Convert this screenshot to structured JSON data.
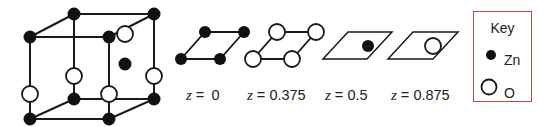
{
  "figure": {
    "colors": {
      "line": "#1a1a1a",
      "zn_fill": "#111111",
      "o_fill": "#ffffff",
      "key_border": "#b24f4a"
    }
  },
  "unit_cell": {
    "atoms": [
      "Zn corners (8)",
      "O on vertical edges (4)",
      "Zn interior (1)",
      "O interior (1)"
    ]
  },
  "layers": [
    {
      "label_var": "z",
      "label_eq": " = ",
      "label_val": "0",
      "atom": "Zn",
      "count": 4
    },
    {
      "label_var": "z",
      "label_eq": " = ",
      "label_val": "0.375",
      "atom": "O",
      "count": 4
    },
    {
      "label_var": "z",
      "label_eq": " = ",
      "label_val": "0.5",
      "atom": "Zn",
      "count": 1
    },
    {
      "label_var": "z",
      "label_eq": " = ",
      "label_val": "0.875",
      "atom": "O",
      "count": 1
    }
  ],
  "key": {
    "title": "Key",
    "items": [
      {
        "symbol": "filled-circle",
        "label": "Zn"
      },
      {
        "symbol": "open-circle",
        "label": "O"
      }
    ]
  }
}
